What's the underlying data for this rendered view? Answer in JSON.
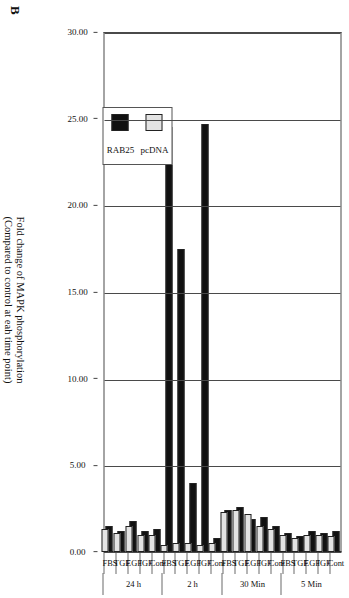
{
  "panel": {
    "letter": "B"
  },
  "chart_data": {
    "type": "bar",
    "orientation": "horizontal-rotated",
    "title": "",
    "xlabel": "",
    "ylabel_lines": [
      "Fold change of MAPK phosphorylation",
      "(Compared to control at eah time point)"
    ],
    "ylim": [
      0,
      30
    ],
    "ticks": [
      "0.00",
      "5.00",
      "10.00",
      "15.00",
      "20.00",
      "25.00",
      "30.00"
    ],
    "tick_values": [
      0,
      5,
      10,
      15,
      20,
      25,
      30
    ],
    "grid": true,
    "legend_position": "inside-left",
    "groups": [
      {
        "label": "5 Min",
        "categories": [
          "Cont",
          "IGF",
          "EGF",
          "TGF",
          "FBS"
        ]
      },
      {
        "label": "30 Min",
        "categories": [
          "Cont",
          "IGF",
          "EGF",
          "TGF",
          "FBS"
        ]
      },
      {
        "label": "2 h",
        "categories": [
          "Cont",
          "IGF",
          "EGF",
          "TGF",
          "FBS"
        ]
      },
      {
        "label": "24 h",
        "categories": [
          "Cont",
          "IGF",
          "EGF",
          "TGF",
          "FBS"
        ]
      }
    ],
    "categories": [
      "Cont",
      "IGF",
      "EGF",
      "TGF",
      "FBS",
      "Cont",
      "IGF",
      "EGF",
      "TGF",
      "FBS",
      "Cont",
      "IGF",
      "EGF",
      "TGF",
      "FBS",
      "Cont",
      "IGF",
      "EGF",
      "TGF",
      "FBS"
    ],
    "series": [
      {
        "name": "pcDNA",
        "color": "#e3e3e3",
        "values": [
          0.9,
          1.0,
          1.0,
          0.8,
          1.0,
          1.3,
          1.5,
          2.2,
          2.4,
          2.3,
          0.5,
          0.4,
          0.5,
          0.5,
          0.4,
          1.0,
          1.0,
          1.5,
          1.1,
          1.3
        ]
      },
      {
        "name": "RAB25",
        "color": "#111111",
        "values": [
          1.2,
          1.1,
          1.2,
          0.9,
          1.1,
          1.5,
          2.0,
          1.9,
          2.6,
          2.4,
          0.8,
          24.7,
          4.0,
          17.5,
          24.5,
          1.3,
          1.2,
          1.8,
          1.2,
          1.5
        ]
      }
    ],
    "legend": [
      {
        "label": "pcDNA",
        "swatch": "#e3e3e3"
      },
      {
        "label": "RAB25",
        "swatch": "#111111"
      }
    ]
  }
}
